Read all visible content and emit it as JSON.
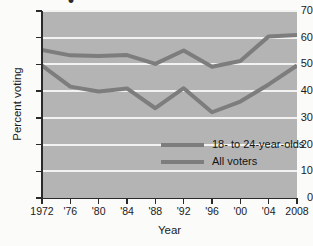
{
  "chart_data": {
    "type": "line",
    "title": "",
    "xlabel": "Year",
    "ylabel": "Percent voting",
    "categories": [
      "1972",
      "'76",
      "'80",
      "'84",
      "'88",
      "'92",
      "'96",
      "'00",
      "'04",
      "2008"
    ],
    "x_values": [
      1972,
      1976,
      1980,
      1984,
      1988,
      1992,
      1996,
      2000,
      2004,
      2008
    ],
    "ylim": [
      0,
      70
    ],
    "xlim": [
      1972,
      2008
    ],
    "y_ticks": [
      0,
      10,
      20,
      30,
      40,
      50,
      60,
      70
    ],
    "y_tick_labels": [
      "0",
      "10",
      "20",
      "30",
      "40",
      "50",
      "60",
      "70"
    ],
    "grid": "horizontal",
    "legend_position": "inside-center-right",
    "series": [
      {
        "name": "18- to 24-year-olds",
        "color": "#7d7d7d",
        "values": [
          55.4,
          53.4,
          53.2,
          53.5,
          50.2,
          55.2,
          49.1,
          51.3,
          60.5,
          61.0
        ]
      },
      {
        "name": "All voters",
        "color": "#7d7d7d",
        "values": [
          49.6,
          41.7,
          39.9,
          41.0,
          33.6,
          41.1,
          32.1,
          36.1,
          42.5,
          49.6
        ]
      }
    ],
    "colors": {
      "plot_background": "#b4b4b4",
      "gridline": "#f2f2f2",
      "line": "#7d7d7d",
      "axis": "#2a2a2a",
      "page_background": "#fbfbfa",
      "text": "#1a1a1a"
    },
    "title_fragment": "•"
  }
}
